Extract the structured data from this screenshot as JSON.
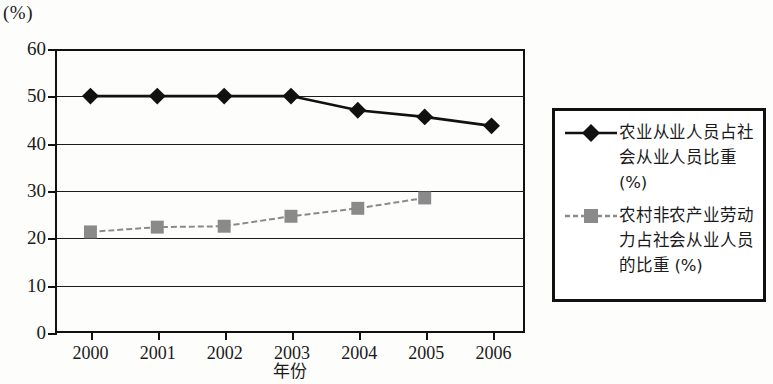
{
  "chart_data": {
    "type": "line",
    "title": "",
    "xlabel": "年份",
    "ylabel": "(%)",
    "y_unit_label": "(%)",
    "categories": [
      "2000",
      "2001",
      "2002",
      "2003",
      "2004",
      "2005",
      "2006"
    ],
    "ylim": [
      0,
      60
    ],
    "ytick_values": [
      "0",
      "10",
      "20",
      "30",
      "40",
      "50",
      "60"
    ],
    "grid": true,
    "legend_position": "right",
    "series": [
      {
        "name": "农业从业人员占社会从业人员比重 (%)",
        "marker": "diamond",
        "color": "#111111",
        "values": [
          50,
          50,
          50,
          50,
          47,
          45.6,
          43.7
        ]
      },
      {
        "name": "农村非农产业劳动力占社会从业人员的比重 (%)",
        "marker": "square",
        "color": "#8a8a8a",
        "values": [
          21.2,
          22.2,
          22.4,
          24.5,
          26.2,
          28.4,
          null
        ]
      }
    ]
  },
  "legend": {
    "entries": [
      {
        "label": "农业从业人员占社会从业人员比重 (%)",
        "key_icon": "diamond-marker-icon"
      },
      {
        "label": "农村非农产业劳动力占社会从业人员的比重 (%)",
        "key_icon": "square-marker-icon"
      }
    ]
  }
}
